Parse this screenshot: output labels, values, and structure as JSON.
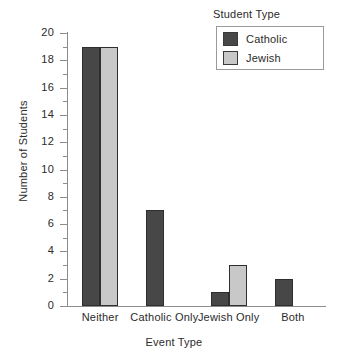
{
  "chart_data": {
    "type": "bar",
    "title": "",
    "xlabel": "Event Type",
    "ylabel": "Number of Students",
    "categories": [
      "Neither",
      "Catholic Only",
      "Jewish Only",
      "Both"
    ],
    "series": [
      {
        "name": "Catholic",
        "values": [
          19,
          7,
          1,
          2
        ],
        "color": "#474747"
      },
      {
        "name": "Jewish",
        "values": [
          19,
          0,
          3,
          0
        ],
        "color": "#c8c8c8"
      }
    ],
    "ylim": [
      0,
      20
    ],
    "ytick_labels": [
      "0",
      "2",
      "4",
      "6",
      "8",
      "10",
      "12",
      "14",
      "16",
      "18",
      "20"
    ],
    "ytick_values": [
      0,
      2,
      4,
      6,
      8,
      10,
      12,
      14,
      16,
      18,
      20
    ],
    "yminor_values": [
      1,
      3,
      5,
      7,
      9,
      11,
      13,
      15,
      17,
      19
    ],
    "grid": false,
    "legend": {
      "title": "Student Type",
      "position": "top-right",
      "entries": [
        {
          "label": "Catholic",
          "color": "#474747"
        },
        {
          "label": "Jewish",
          "color": "#c8c8c8"
        }
      ]
    }
  }
}
